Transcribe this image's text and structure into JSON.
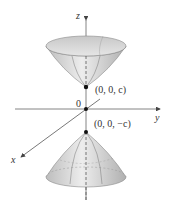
{
  "figure": {
    "type": "hyperboloid-of-two-sheets",
    "axes": {
      "z_label": "z",
      "y_label": "y",
      "x_label": "x",
      "origin_label": "0"
    },
    "points": {
      "upper_vertex": "(0, 0, c)",
      "lower_vertex": "(0, 0, −c)"
    },
    "colors": {
      "surface_light": "#eeeeee",
      "surface_dark": "#b8b8b8",
      "axis": "#555555",
      "text": "#333333"
    }
  }
}
